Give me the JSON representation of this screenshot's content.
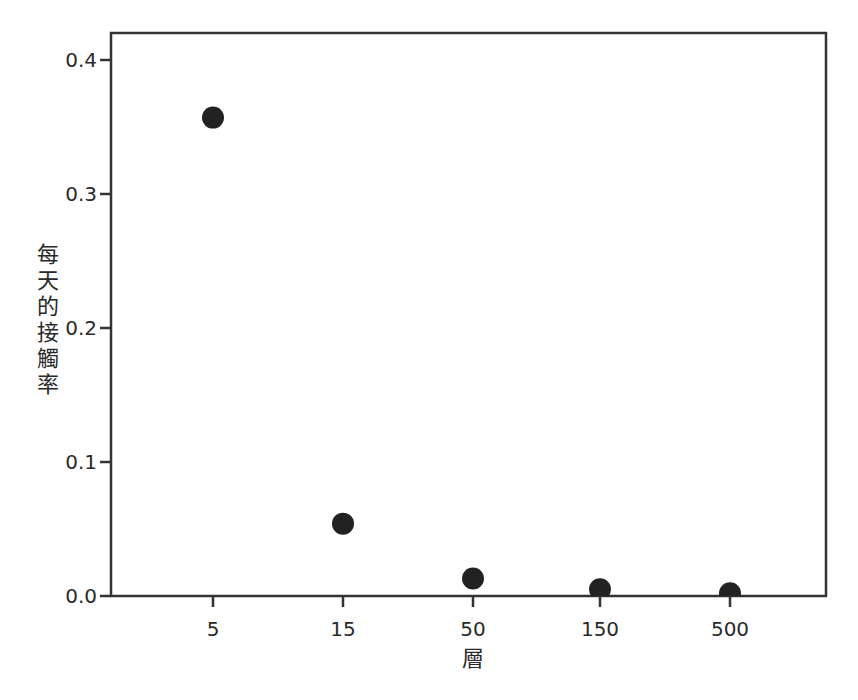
{
  "chart_data": {
    "type": "scatter",
    "title": "",
    "xlabel": "層",
    "ylabel": "每天的接觸率",
    "x_scale": "categorical",
    "categories": [
      "5",
      "15",
      "50",
      "150",
      "500"
    ],
    "values": [
      0.357,
      0.054,
      0.013,
      0.005,
      0.002
    ],
    "series": [
      {
        "name": "每天的接觸率",
        "x": [
          "5",
          "15",
          "50",
          "150",
          "500"
        ],
        "values": [
          0.357,
          0.054,
          0.013,
          0.005,
          0.002
        ]
      }
    ],
    "yticks": [
      "0.0",
      "0.1",
      "0.2",
      "0.3",
      "0.4"
    ],
    "ylim": [
      0,
      0.425
    ],
    "grid": false,
    "legend": "none",
    "marker_color": "#222222",
    "frame_color": "#333333"
  },
  "axes": {
    "xlabel": "層",
    "ylabel_chars": [
      "每",
      "天",
      "的",
      "接",
      "觸",
      "率"
    ]
  }
}
